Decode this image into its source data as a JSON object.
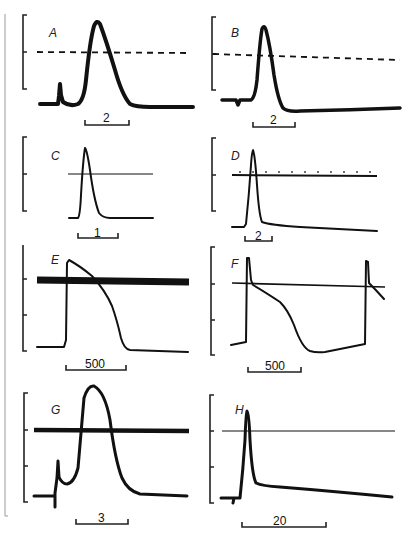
{
  "figure": {
    "panels": [
      {
        "id": "A",
        "label": "A",
        "scale_bar": "2",
        "reference_line": "dashed"
      },
      {
        "id": "B",
        "label": "B",
        "scale_bar": "2",
        "reference_line": "dashed"
      },
      {
        "id": "C",
        "label": "C",
        "scale_bar": "1",
        "reference_line": "thin"
      },
      {
        "id": "D",
        "label": "D",
        "scale_bar": "2",
        "reference_line": "thin-with-ticks"
      },
      {
        "id": "E",
        "label": "E",
        "scale_bar": "500",
        "reference_line": "thick"
      },
      {
        "id": "F",
        "label": "F",
        "scale_bar": "500",
        "reference_line": "thin"
      },
      {
        "id": "G",
        "label": "G",
        "scale_bar": "3",
        "reference_line": "thick"
      },
      {
        "id": "H",
        "label": "H",
        "scale_bar": "20",
        "reference_line": "thin"
      }
    ],
    "colors": {
      "ink": "#111111",
      "background": "#ffffff",
      "border": "#888888"
    }
  }
}
